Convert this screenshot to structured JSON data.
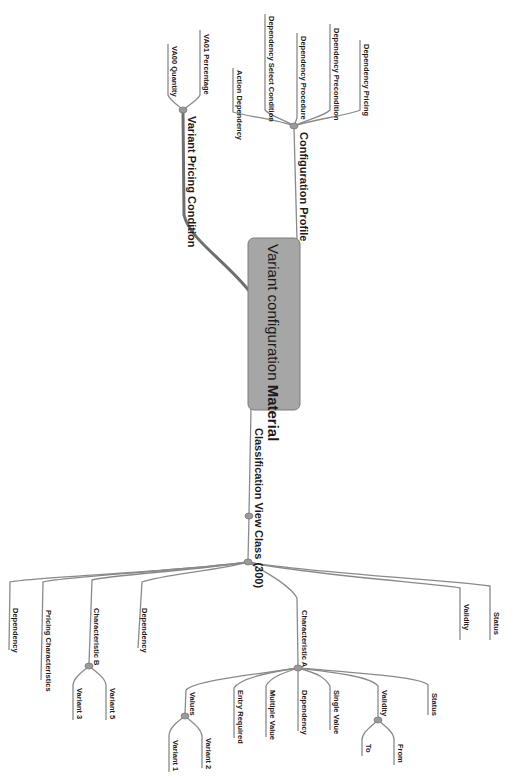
{
  "diagram": {
    "type": "mind-map",
    "orientation": "rotated-90-clockwise",
    "colors": {
      "root_fill": "#a6a6a6",
      "root_stroke": "#7c7c7c",
      "edge": "#8a8a8a",
      "node_dot": "#9a9a9a",
      "text": "#1a1a1a",
      "background": "#ffffff"
    },
    "root": {
      "label_part1": "Variant configuration ",
      "label_part2": "Material"
    },
    "branches": {
      "configuration_profile": {
        "label": "Configuration Profile",
        "children": [
          "Dependency Pricing",
          "Dependency Precondition",
          "Dependency Procedure",
          "Dependency Select Condition",
          "Action Dependency"
        ]
      },
      "variant_pricing_condition": {
        "label": "Variant Pricing Condition",
        "children": [
          "VA01 Percentage",
          "VA00 Quantity"
        ]
      },
      "classification_view": {
        "label": "Classification View",
        "class": {
          "label": "Class (300)",
          "children": {
            "status": "Status",
            "validity": "Validity",
            "characteristic_a": {
              "label": "Characteristic A",
              "children": {
                "status": "Status",
                "validity": {
                  "label": "Validity",
                  "children": [
                    "From",
                    "To"
                  ]
                },
                "single_value": "Single Value",
                "dependency": "Dependency",
                "multiple_value": "Multiple Value",
                "entry_required": "Entry Required",
                "values": {
                  "label": "Values",
                  "children": [
                    "Variant 2",
                    "Variant 1"
                  ]
                }
              }
            },
            "dependency_1": "Dependency",
            "characteristic_b": {
              "label": "Characteristic B",
              "children": [
                "Variant 5",
                "Variant 3"
              ]
            },
            "pricing_characteristics": "Pricing Characteristics",
            "dependency_2": "Dependency"
          }
        }
      }
    }
  }
}
